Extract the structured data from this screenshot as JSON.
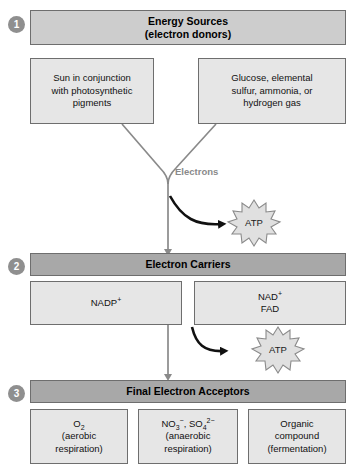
{
  "diagram": {
    "colors": {
      "header_light": "#cdcdcd",
      "header_dark": "#a8a8a8",
      "sub_box_fill": "#e6e6e6",
      "border": "#6e6e6e",
      "badge_fill": "#8f8f8f",
      "connector_gray": "#8a8a8a",
      "atp_arrow_black": "#000000",
      "atp_fill": "#e0e0e0"
    }
  },
  "steps": [
    {
      "number": "1",
      "header_line1": "Energy Sources",
      "header_line2": "(electron donors)",
      "boxes": [
        {
          "lines": [
            "Sun in conjunction",
            "with photosynthetic",
            "pigments"
          ]
        },
        {
          "lines": [
            "Glucose, elemental",
            "sulfur, ammonia, or",
            "hydrogen gas"
          ]
        }
      ]
    },
    {
      "number": "2",
      "header_line1": "Electron Carriers",
      "header_line2": "",
      "boxes": [
        {
          "lines": [
            "NADP+"
          ]
        },
        {
          "lines": [
            "NAD+",
            "FAD"
          ]
        }
      ]
    },
    {
      "number": "3",
      "header_line1": "Final Electron Acceptors",
      "header_line2": "",
      "boxes": [
        {
          "lines": [
            "O2",
            "(aerobic",
            "respiration)"
          ]
        },
        {
          "lines": [
            "NO3-, SO42-",
            "(anaerobic",
            "respiration)"
          ]
        },
        {
          "lines": [
            "Organic",
            "compound",
            "(fermentation)"
          ]
        }
      ]
    }
  ],
  "labels": {
    "electrons": "Electrons",
    "atp_upper": "ATP",
    "atp_lower": "ATP"
  }
}
